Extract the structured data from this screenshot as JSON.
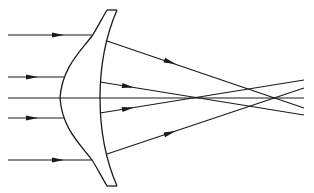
{
  "diagram": {
    "colors": {
      "stroke": "#1a1a1a",
      "background": "#ffffff"
    },
    "lens": {
      "type": "meniscus-aspheric",
      "top_edge": [
        [
          107,
          10
        ],
        [
          117,
          10
        ]
      ],
      "bottom_edge": [
        [
          107,
          186
        ],
        [
          117,
          186
        ]
      ]
    },
    "incoming_rays": [
      {
        "y": 35,
        "x_start": 8,
        "x_end": 92,
        "arrow_x": 60
      },
      {
        "y": 77,
        "x_start": 8,
        "x_end": 64,
        "arrow_x": 33
      },
      {
        "y": 98,
        "x_start": 8,
        "x_end": 304,
        "arrow_x": null,
        "label": "optical-axis"
      },
      {
        "y": 118,
        "x_start": 8,
        "x_end": 64,
        "arrow_x": 33
      },
      {
        "y": 160,
        "x_start": 8,
        "x_end": 92,
        "arrow_x": 60
      }
    ],
    "refracted_rays": [
      {
        "from": [
          107,
          41
        ],
        "to": [
          304,
          108
        ],
        "arrow_at": [
          170,
          62
        ]
      },
      {
        "from": [
          100,
          82
        ],
        "to": [
          304,
          115
        ],
        "arrow_at": [
          128,
          86
        ]
      },
      {
        "from": [
          100,
          113
        ],
        "to": [
          304,
          80
        ],
        "arrow_at": [
          128,
          109
        ]
      },
      {
        "from": [
          107,
          154
        ],
        "to": [
          304,
          88
        ],
        "arrow_at": [
          170,
          133
        ]
      }
    ]
  }
}
